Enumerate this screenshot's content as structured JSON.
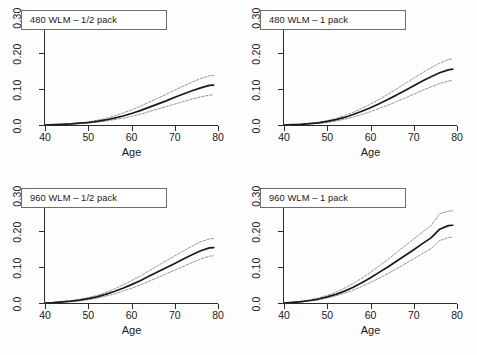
{
  "figure": {
    "background": "#ffffff",
    "line_color": "#1a1a1a",
    "ci_color": "#8a8a8a",
    "axis_color": "#2b2b2b"
  },
  "axis": {
    "xlabel": "Age",
    "x_ticks": [
      "40",
      "50",
      "60",
      "70",
      "80"
    ],
    "y_ticks": [
      "0.0",
      "0.10",
      "0.20",
      "0.30"
    ],
    "xlim": [
      40,
      80
    ],
    "ylim": [
      0.0,
      0.3
    ]
  },
  "panels": [
    {
      "id": "panel-480-half",
      "label": "480 WLM – 1/2 pack"
    },
    {
      "id": "panel-480-one",
      "label": "480 WLM – 1 pack"
    },
    {
      "id": "panel-960-half",
      "label": "960 WLM – 1/2 pack"
    },
    {
      "id": "panel-960-one",
      "label": "960 WLM – 1 pack"
    }
  ],
  "chart_data": [
    {
      "type": "line",
      "title": "480 WLM – 1/2 pack",
      "xlabel": "Age",
      "ylabel": "",
      "xlim": [
        40,
        80
      ],
      "ylim": [
        0.0,
        0.3
      ],
      "grid": false,
      "legend": "none",
      "x": [
        40,
        42,
        44,
        46,
        48,
        50,
        52,
        54,
        56,
        58,
        60,
        62,
        64,
        66,
        68,
        70,
        72,
        74,
        76,
        78,
        79
      ],
      "series": [
        {
          "name": "estimate",
          "values": [
            0.0,
            0.001,
            0.002,
            0.003,
            0.005,
            0.007,
            0.01,
            0.014,
            0.019,
            0.025,
            0.032,
            0.04,
            0.049,
            0.058,
            0.067,
            0.077,
            0.086,
            0.095,
            0.103,
            0.11,
            0.111
          ]
        },
        {
          "name": "upper_ci",
          "values": [
            0.0,
            0.001,
            0.002,
            0.004,
            0.006,
            0.009,
            0.013,
            0.018,
            0.025,
            0.033,
            0.042,
            0.052,
            0.063,
            0.074,
            0.085,
            0.097,
            0.108,
            0.119,
            0.129,
            0.137,
            0.138
          ]
        },
        {
          "name": "lower_ci",
          "values": [
            0.0,
            0.001,
            0.002,
            0.002,
            0.004,
            0.005,
            0.008,
            0.011,
            0.015,
            0.019,
            0.024,
            0.03,
            0.037,
            0.044,
            0.051,
            0.058,
            0.065,
            0.072,
            0.078,
            0.083,
            0.084
          ]
        }
      ]
    },
    {
      "type": "line",
      "title": "480 WLM – 1 pack",
      "xlabel": "Age",
      "ylabel": "",
      "xlim": [
        40,
        80
      ],
      "ylim": [
        0.0,
        0.3
      ],
      "grid": false,
      "legend": "none",
      "x": [
        40,
        42,
        44,
        46,
        48,
        50,
        52,
        54,
        56,
        58,
        60,
        62,
        64,
        66,
        68,
        70,
        72,
        74,
        76,
        78,
        79
      ],
      "series": [
        {
          "name": "estimate",
          "values": [
            0.0,
            0.001,
            0.002,
            0.004,
            0.006,
            0.01,
            0.015,
            0.021,
            0.029,
            0.038,
            0.048,
            0.059,
            0.071,
            0.083,
            0.096,
            0.109,
            0.122,
            0.134,
            0.145,
            0.153,
            0.155
          ]
        },
        {
          "name": "upper_ci",
          "values": [
            0.0,
            0.001,
            0.003,
            0.005,
            0.008,
            0.012,
            0.018,
            0.026,
            0.035,
            0.046,
            0.058,
            0.071,
            0.085,
            0.1,
            0.115,
            0.13,
            0.145,
            0.159,
            0.172,
            0.182,
            0.184
          ]
        },
        {
          "name": "lower_ci",
          "values": [
            0.0,
            0.001,
            0.002,
            0.003,
            0.005,
            0.007,
            0.011,
            0.016,
            0.022,
            0.029,
            0.037,
            0.046,
            0.055,
            0.065,
            0.075,
            0.086,
            0.096,
            0.106,
            0.115,
            0.122,
            0.124
          ]
        }
      ]
    },
    {
      "type": "line",
      "title": "960 WLM – 1/2 pack",
      "xlabel": "Age",
      "ylabel": "",
      "xlim": [
        40,
        80
      ],
      "ylim": [
        0.0,
        0.3
      ],
      "grid": false,
      "legend": "none",
      "x": [
        40,
        42,
        44,
        46,
        48,
        50,
        52,
        54,
        56,
        58,
        60,
        62,
        64,
        66,
        68,
        70,
        72,
        74,
        76,
        78,
        79
      ],
      "series": [
        {
          "name": "estimate",
          "values": [
            0.0,
            0.001,
            0.003,
            0.005,
            0.008,
            0.012,
            0.017,
            0.024,
            0.032,
            0.041,
            0.051,
            0.062,
            0.074,
            0.086,
            0.098,
            0.11,
            0.122,
            0.134,
            0.145,
            0.153,
            0.154
          ]
        },
        {
          "name": "upper_ci",
          "values": [
            0.0,
            0.002,
            0.004,
            0.006,
            0.01,
            0.015,
            0.021,
            0.029,
            0.039,
            0.05,
            0.062,
            0.075,
            0.089,
            0.103,
            0.117,
            0.131,
            0.145,
            0.158,
            0.17,
            0.178,
            0.179
          ]
        },
        {
          "name": "lower_ci",
          "values": [
            0.0,
            0.001,
            0.002,
            0.004,
            0.006,
            0.009,
            0.013,
            0.019,
            0.025,
            0.033,
            0.041,
            0.05,
            0.06,
            0.07,
            0.081,
            0.091,
            0.102,
            0.112,
            0.122,
            0.13,
            0.131
          ]
        }
      ]
    },
    {
      "type": "line",
      "title": "960 WLM – 1 pack",
      "xlabel": "Age",
      "ylabel": "",
      "xlim": [
        40,
        80
      ],
      "ylim": [
        0.0,
        0.3
      ],
      "grid": false,
      "legend": "none",
      "x": [
        40,
        42,
        44,
        46,
        48,
        50,
        52,
        54,
        56,
        58,
        60,
        62,
        64,
        66,
        68,
        70,
        72,
        74,
        76,
        78,
        79
      ],
      "series": [
        {
          "name": "estimate",
          "values": [
            0.0,
            0.002,
            0.004,
            0.007,
            0.011,
            0.017,
            0.024,
            0.033,
            0.044,
            0.056,
            0.07,
            0.085,
            0.1,
            0.116,
            0.132,
            0.148,
            0.165,
            0.181,
            0.205,
            0.215,
            0.216
          ]
        },
        {
          "name": "upper_ci",
          "values": [
            0.0,
            0.002,
            0.005,
            0.009,
            0.014,
            0.021,
            0.03,
            0.041,
            0.054,
            0.069,
            0.085,
            0.103,
            0.121,
            0.14,
            0.159,
            0.178,
            0.197,
            0.215,
            0.248,
            0.255,
            0.256
          ]
        },
        {
          "name": "lower_ci",
          "values": [
            0.0,
            0.001,
            0.003,
            0.006,
            0.009,
            0.014,
            0.02,
            0.027,
            0.036,
            0.046,
            0.057,
            0.069,
            0.082,
            0.095,
            0.109,
            0.123,
            0.137,
            0.151,
            0.173,
            0.182,
            0.183
          ]
        }
      ]
    }
  ]
}
